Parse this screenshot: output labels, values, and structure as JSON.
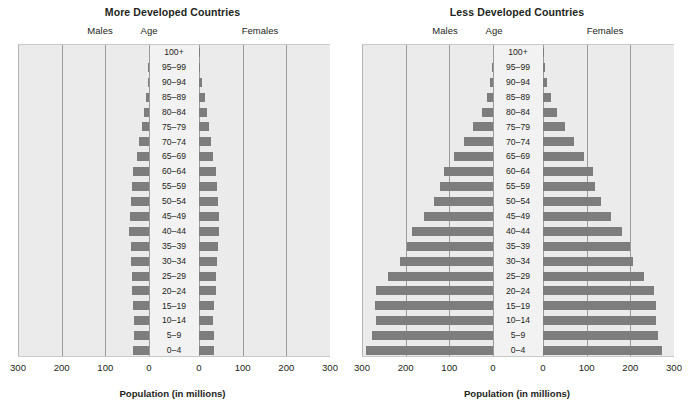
{
  "figure": {
    "axis_label": "Population (in millions)",
    "male_header": "Males",
    "female_header": "Females",
    "age_header": "Age",
    "bar_color": "#7d7d7d",
    "plot_background": "#ebebeb",
    "age_column_background": "#f2f2f2",
    "gridline_color": "#9a9a9a"
  },
  "chart_data": [
    {
      "type": "bar",
      "subtype": "population-pyramid",
      "title": "More Developed Countries",
      "xlabel": "Population (in millions)",
      "ylabel": "Age",
      "grid": true,
      "legend": "none",
      "xlim": [
        -300,
        300
      ],
      "xticks_left": [
        "300",
        "200",
        "100",
        "0"
      ],
      "xticks_right": [
        "0",
        "100",
        "200",
        "300"
      ],
      "categories": [
        "100+",
        "95–99",
        "90–94",
        "85–89",
        "80–84",
        "75–79",
        "70–74",
        "65–69",
        "60–64",
        "55–59",
        "50–54",
        "45–49",
        "40–44",
        "35–39",
        "30–34",
        "25–29",
        "20–24",
        "15–19",
        "10–14",
        "5–9",
        "0–4"
      ],
      "series": [
        {
          "name": "Males",
          "side": "left",
          "values": [
            0,
            1,
            3,
            7,
            11,
            16,
            22,
            27,
            36,
            39,
            42,
            44,
            45,
            42,
            41,
            39,
            39,
            37,
            35,
            35,
            37
          ]
        },
        {
          "name": "Females",
          "side": "right",
          "values": [
            1,
            3,
            7,
            13,
            19,
            24,
            28,
            31,
            39,
            42,
            44,
            45,
            46,
            43,
            41,
            39,
            38,
            35,
            33,
            34,
            35
          ]
        }
      ]
    },
    {
      "type": "bar",
      "subtype": "population-pyramid",
      "title": "Less Developed Countries",
      "xlabel": "Population (in millions)",
      "ylabel": "Age",
      "grid": true,
      "legend": "none",
      "xlim": [
        -300,
        300
      ],
      "xticks_left": [
        "300",
        "200",
        "100",
        "0"
      ],
      "xticks_right": [
        "0",
        "100",
        "200",
        "300"
      ],
      "categories": [
        "100+",
        "95–99",
        "90–94",
        "85–89",
        "80–84",
        "75–79",
        "70–74",
        "65–69",
        "60–64",
        "55–59",
        "50–54",
        "45–49",
        "40–44",
        "35–39",
        "30–34",
        "25–29",
        "20–24",
        "15–19",
        "10–14",
        "5–9",
        "0–4"
      ],
      "series": [
        {
          "name": "Males",
          "side": "left",
          "values": [
            0,
            2,
            6,
            14,
            26,
            45,
            67,
            89,
            113,
            122,
            134,
            158,
            185,
            198,
            212,
            240,
            268,
            271,
            269,
            278,
            290
          ]
        },
        {
          "name": "Females",
          "side": "right",
          "values": [
            1,
            4,
            9,
            18,
            31,
            51,
            72,
            93,
            115,
            118,
            133,
            155,
            182,
            199,
            206,
            231,
            254,
            258,
            259,
            263,
            273
          ]
        }
      ]
    }
  ]
}
